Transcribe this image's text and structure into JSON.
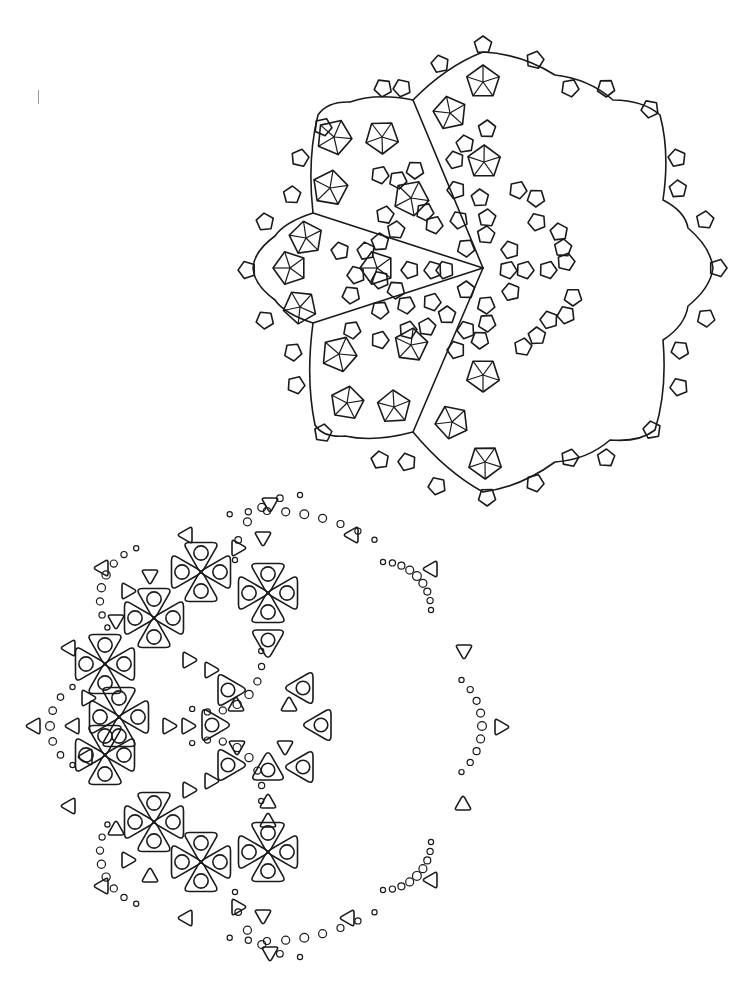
{
  "page": {
    "background": "#ffffff",
    "stroke": "#1a1a1a"
  },
  "stray_mark": {
    "x": 38,
    "y": 90,
    "h": 14
  },
  "top_mandala": {
    "center": [
      483,
      268
    ],
    "outline_points": [
      [
        483,
        52
      ],
      [
        555,
        75
      ],
      [
        613,
        100
      ],
      [
        660,
        115
      ],
      [
        663,
        200
      ],
      [
        688,
        228
      ],
      [
        713,
        268
      ],
      [
        688,
        306
      ],
      [
        663,
        340
      ],
      [
        655,
        430
      ],
      [
        610,
        440
      ],
      [
        555,
        462
      ],
      [
        483,
        492
      ],
      [
        413,
        432
      ],
      [
        345,
        436
      ],
      [
        315,
        425
      ],
      [
        313,
        323
      ],
      [
        275,
        300
      ],
      [
        253,
        268
      ],
      [
        275,
        236
      ],
      [
        313,
        213
      ],
      [
        318,
        115
      ],
      [
        350,
        102
      ],
      [
        413,
        100
      ]
    ],
    "sector_lines": [
      [
        413,
        100
      ],
      [
        313,
        213
      ],
      [
        313,
        323
      ],
      [
        413,
        432
      ]
    ],
    "spoked_pentagons": [
      [
        483,
        82,
        17
      ],
      [
        450,
        113,
        17
      ],
      [
        334,
        137,
        18
      ],
      [
        382,
        137,
        17
      ],
      [
        330,
        188,
        18
      ],
      [
        411,
        198,
        18
      ],
      [
        484,
        162,
        17
      ],
      [
        306,
        238,
        17
      ],
      [
        290,
        268,
        17
      ],
      [
        300,
        307,
        17
      ],
      [
        377,
        268,
        17
      ],
      [
        339,
        354,
        18
      ],
      [
        411,
        345,
        17
      ],
      [
        347,
        403,
        17
      ],
      [
        394,
        407,
        17
      ],
      [
        452,
        422,
        17
      ],
      [
        483,
        375,
        17
      ],
      [
        485,
        462,
        17
      ]
    ],
    "small_pentagons": [
      [
        440,
        64
      ],
      [
        383,
        88
      ],
      [
        402,
        88
      ],
      [
        323,
        127
      ],
      [
        300,
        158
      ],
      [
        292,
        195
      ],
      [
        265,
        222
      ],
      [
        247,
        270
      ],
      [
        265,
        320
      ],
      [
        293,
        352
      ],
      [
        296,
        385
      ],
      [
        323,
        433
      ],
      [
        380,
        460
      ],
      [
        407,
        462
      ],
      [
        437,
        486
      ],
      [
        487,
        497
      ],
      [
        535,
        483
      ],
      [
        570,
        458
      ],
      [
        606,
        458
      ],
      [
        652,
        430
      ],
      [
        679,
        387
      ],
      [
        680,
        350
      ],
      [
        706,
        318
      ],
      [
        718,
        268
      ],
      [
        705,
        220
      ],
      [
        678,
        189
      ],
      [
        677,
        158
      ],
      [
        650,
        109
      ],
      [
        606,
        88
      ],
      [
        570,
        88
      ],
      [
        535,
        60
      ],
      [
        483,
        45
      ],
      [
        487,
        129
      ],
      [
        465,
        144
      ],
      [
        455,
        160
      ],
      [
        456,
        190
      ],
      [
        425,
        212
      ],
      [
        396,
        230
      ],
      [
        380,
        242
      ],
      [
        366,
        251
      ],
      [
        380,
        280
      ],
      [
        406,
        305
      ],
      [
        380,
        310
      ],
      [
        351,
        295
      ],
      [
        434,
        225
      ],
      [
        459,
        220
      ],
      [
        480,
        198
      ],
      [
        487,
        218
      ],
      [
        486,
        235
      ],
      [
        466,
        248
      ],
      [
        445,
        270
      ],
      [
        410,
        270
      ],
      [
        433,
        270
      ],
      [
        466,
        290
      ],
      [
        486,
        305
      ],
      [
        487,
        323
      ],
      [
        480,
        340
      ],
      [
        456,
        350
      ],
      [
        427,
        327
      ],
      [
        432,
        302
      ],
      [
        396,
        290
      ],
      [
        356,
        275
      ],
      [
        340,
        251
      ],
      [
        518,
        190
      ],
      [
        536,
        198
      ],
      [
        537,
        222
      ],
      [
        559,
        232
      ],
      [
        563,
        248
      ],
      [
        510,
        250
      ],
      [
        508,
        270
      ],
      [
        525,
        270
      ],
      [
        548,
        270
      ],
      [
        566,
        262
      ],
      [
        573,
        297
      ],
      [
        566,
        315
      ],
      [
        549,
        320
      ],
      [
        537,
        336
      ],
      [
        523,
        347
      ],
      [
        511,
        292
      ],
      [
        466,
        330
      ],
      [
        447,
        315
      ],
      [
        408,
        330
      ],
      [
        398,
        180
      ],
      [
        380,
        175
      ],
      [
        415,
        170
      ],
      [
        385,
        215
      ],
      [
        352,
        330
      ],
      [
        380,
        340
      ]
    ]
  },
  "bottom_mandala": {
    "center": [
      267,
      726
    ],
    "clover_clusters": [
      [
        201,
        572
      ],
      [
        268,
        593
      ],
      [
        154,
        618
      ],
      [
        105,
        664
      ],
      [
        105,
        755
      ],
      [
        154,
        822
      ],
      [
        201,
        862
      ],
      [
        268,
        852
      ],
      [
        119,
        717
      ]
    ],
    "eye_triangles": [
      [
        268,
        640,
        "down"
      ],
      [
        228,
        690,
        "right"
      ],
      [
        212,
        725,
        "right"
      ],
      [
        268,
        770,
        "up"
      ],
      [
        228,
        765,
        "right"
      ],
      [
        303,
        688,
        "left"
      ],
      [
        321,
        725,
        "left"
      ],
      [
        303,
        767,
        "left"
      ],
      [
        268,
        735,
        "none"
      ]
    ],
    "small_triangles": [
      [
        270,
        503,
        "down"
      ],
      [
        187,
        535,
        "left"
      ],
      [
        263,
        537,
        "down"
      ],
      [
        237,
        548,
        "right"
      ],
      [
        103,
        568,
        "left"
      ],
      [
        150,
        575,
        "down"
      ],
      [
        127,
        591,
        "right"
      ],
      [
        116,
        620,
        "down"
      ],
      [
        70,
        648,
        "left"
      ],
      [
        188,
        660,
        "right"
      ],
      [
        210,
        670,
        "right"
      ],
      [
        87,
        698,
        "right"
      ],
      [
        35,
        726,
        "left"
      ],
      [
        74,
        726,
        "left"
      ],
      [
        168,
        726,
        "right"
      ],
      [
        187,
        726,
        "right"
      ],
      [
        236,
        706,
        "up"
      ],
      [
        237,
        746,
        "down"
      ],
      [
        289,
        706,
        "up"
      ],
      [
        285,
        746,
        "down"
      ],
      [
        87,
        757,
        "left"
      ],
      [
        70,
        806,
        "left"
      ],
      [
        116,
        830,
        "up"
      ],
      [
        188,
        790,
        "right"
      ],
      [
        210,
        781,
        "right"
      ],
      [
        268,
        803,
        "up"
      ],
      [
        268,
        822,
        "up"
      ],
      [
        127,
        860,
        "right"
      ],
      [
        150,
        877,
        "up"
      ],
      [
        103,
        886,
        "left"
      ],
      [
        237,
        907,
        "right"
      ],
      [
        263,
        915,
        "down"
      ],
      [
        187,
        918,
        "left"
      ],
      [
        270,
        952,
        "down"
      ],
      [
        353,
        535,
        "left"
      ],
      [
        432,
        569,
        "left"
      ],
      [
        464,
        650,
        "down"
      ],
      [
        500,
        727,
        "right"
      ],
      [
        463,
        805,
        "up"
      ],
      [
        432,
        880,
        "left"
      ],
      [
        349,
        918,
        "left"
      ]
    ],
    "dot_arcs": [
      {
        "cx": 267,
        "cy": 726,
        "r": 215,
        "start": -100,
        "end": -60,
        "n": 9
      },
      {
        "cx": 267,
        "cy": 726,
        "r": 215,
        "start": 60,
        "end": 100,
        "n": 9
      },
      {
        "cx": 155,
        "cy": 600,
        "r": 55,
        "start": 150,
        "end": 250,
        "n": 8
      },
      {
        "cx": 155,
        "cy": 852,
        "r": 55,
        "start": 110,
        "end": 210,
        "n": 8
      },
      {
        "cx": 95,
        "cy": 726,
        "r": 45,
        "start": 120,
        "end": 240,
        "n": 7
      },
      {
        "cx": 210,
        "cy": 660,
        "r": 52,
        "start": -10,
        "end": 110,
        "n": 8
      },
      {
        "cx": 210,
        "cy": 792,
        "r": 52,
        "start": -110,
        "end": 10,
        "n": 8
      },
      {
        "cx": 300,
        "cy": 560,
        "r": 65,
        "start": 180,
        "end": 270,
        "n": 6
      },
      {
        "cx": 300,
        "cy": 892,
        "r": 65,
        "start": 90,
        "end": 180,
        "n": 6
      },
      {
        "cx": 383,
        "cy": 610,
        "r": 48,
        "start": -90,
        "end": 0,
        "n": 9
      },
      {
        "cx": 383,
        "cy": 842,
        "r": 48,
        "start": 0,
        "end": 90,
        "n": 9
      },
      {
        "cx": 420,
        "cy": 726,
        "r": 62,
        "start": -48,
        "end": 48,
        "n": 9
      }
    ]
  }
}
